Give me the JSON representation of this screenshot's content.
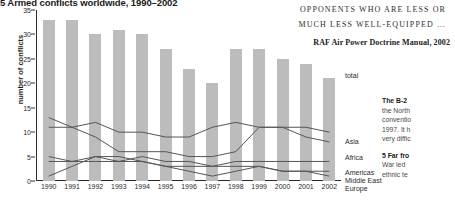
{
  "figure": {
    "title": "5 Armed conflicts worldwide, 1990–2002"
  },
  "quote": {
    "line1": "OPPONENTS WHO ARE LESS OR",
    "line2": "MUCH LESS WELL-EQUIPPED …",
    "citation": "RAF Air Power Doctrine Manual, 2002"
  },
  "sidebar": {
    "block1_heading": "The B-2",
    "block1_lines": [
      "the North",
      "conventio",
      "1997. It h",
      "very diffic"
    ],
    "block2_heading": "5 Far fro",
    "block2_lines": [
      "War led",
      "ethnic te"
    ]
  },
  "chart_data": {
    "type": "bar",
    "title": "5 Armed conflicts worldwide, 1990–2002",
    "xlabel": "",
    "ylabel": "number of conflicts",
    "ylim": [
      0,
      35
    ],
    "yticks": [
      0,
      5,
      10,
      15,
      20,
      25,
      30,
      35
    ],
    "grid": false,
    "legend_position": "right-inline",
    "categories": [
      "1990",
      "1991",
      "1992",
      "1993",
      "1994",
      "1995",
      "1996",
      "1997",
      "1998",
      "1999",
      "2000",
      "2001",
      "2002"
    ],
    "bars": {
      "name": "total",
      "values": [
        33,
        33,
        30,
        31,
        30,
        27,
        23,
        20,
        27,
        27,
        25,
        24,
        21
      ]
    },
    "series": [
      {
        "name": "Asia",
        "values": [
          13,
          11,
          12,
          10,
          10,
          9,
          9,
          11,
          12,
          11,
          11,
          11,
          10
        ]
      },
      {
        "name": "Africa",
        "values": [
          11,
          11,
          9,
          6,
          6,
          6,
          5,
          5,
          6,
          11,
          11,
          9,
          8
        ]
      },
      {
        "name": "Americas",
        "values": [
          5,
          4,
          5,
          4,
          4,
          3,
          3,
          3,
          3,
          3,
          2,
          2,
          2
        ]
      },
      {
        "name": "Middle East",
        "values": [
          4,
          4,
          4,
          4,
          5,
          4,
          4,
          3,
          4,
          4,
          4,
          4,
          4
        ]
      },
      {
        "name": "Europe",
        "values": [
          1,
          3,
          5,
          5,
          4,
          3,
          2,
          1,
          2,
          3,
          2,
          2,
          1
        ]
      }
    ]
  }
}
